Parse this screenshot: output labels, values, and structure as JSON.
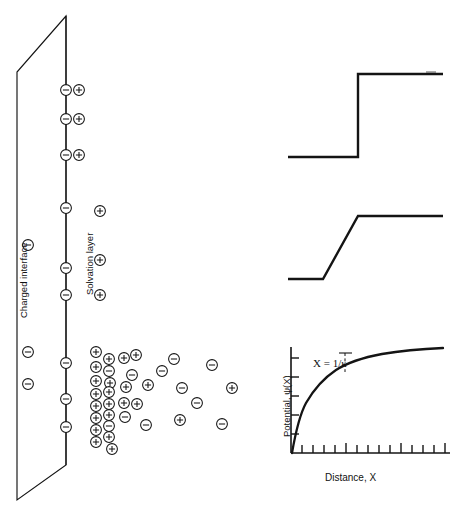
{
  "figure": {
    "stroke_color": "#141414",
    "panels": {
      "left": {
        "name": "interface-schematic",
        "labels": {
          "interface": "Charged interface",
          "solvation": "Solvation layer"
        },
        "interface_plane": {
          "top_right": [
            66,
            16
          ],
          "top_left": [
            17,
            72
          ],
          "bottom_left": [
            17,
            500
          ],
          "bottom_right": [
            66,
            465
          ]
        },
        "solvation_line": {
          "x": 66,
          "y_top": 16,
          "y_bottom": 465
        },
        "surface_charges": [
          {
            "sign": "minus",
            "x": 28,
            "y": 245
          },
          {
            "sign": "minus",
            "x": 28,
            "y": 352
          },
          {
            "sign": "minus",
            "x": 28,
            "y": 384
          }
        ],
        "solvation_pairs": [
          {
            "minus_x": 66,
            "plus_x": 79,
            "y": 90
          },
          {
            "minus_x": 66,
            "plus_x": 79,
            "y": 119
          },
          {
            "minus_x": 66,
            "plus_x": 79,
            "y": 155
          }
        ],
        "solvation_singles": [
          {
            "sign": "minus",
            "x": 66,
            "y": 208
          },
          {
            "sign": "minus",
            "x": 66,
            "y": 268
          },
          {
            "sign": "minus",
            "x": 66,
            "y": 295
          },
          {
            "sign": "minus",
            "x": 66,
            "y": 363
          },
          {
            "sign": "minus",
            "x": 66,
            "y": 399
          },
          {
            "sign": "minus",
            "x": 66,
            "y": 427
          }
        ],
        "diffuse_ions": [
          {
            "sign": "plus",
            "x": 100,
            "y": 211
          },
          {
            "sign": "plus",
            "x": 100,
            "y": 260
          },
          {
            "sign": "plus",
            "x": 100,
            "y": 295
          },
          {
            "sign": "plus",
            "x": 96,
            "y": 352
          },
          {
            "sign": "plus",
            "x": 109,
            "y": 359
          },
          {
            "sign": "plus",
            "x": 96,
            "y": 367
          },
          {
            "sign": "minus",
            "x": 109,
            "y": 371
          },
          {
            "sign": "plus",
            "x": 96,
            "y": 381
          },
          {
            "sign": "plus",
            "x": 110,
            "y": 383
          },
          {
            "sign": "plus",
            "x": 96,
            "y": 394
          },
          {
            "sign": "plus",
            "x": 109,
            "y": 392
          },
          {
            "sign": "plus",
            "x": 96,
            "y": 406
          },
          {
            "sign": "plus",
            "x": 109,
            "y": 404
          },
          {
            "sign": "plus",
            "x": 96,
            "y": 418
          },
          {
            "sign": "plus",
            "x": 109,
            "y": 415
          },
          {
            "sign": "minus",
            "x": 109,
            "y": 426
          },
          {
            "sign": "plus",
            "x": 96,
            "y": 430
          },
          {
            "sign": "plus",
            "x": 109,
            "y": 437
          },
          {
            "sign": "plus",
            "x": 96,
            "y": 442
          },
          {
            "sign": "plus",
            "x": 112,
            "y": 449
          },
          {
            "sign": "plus",
            "x": 124,
            "y": 358
          },
          {
            "sign": "plus",
            "x": 136,
            "y": 355
          },
          {
            "sign": "minus",
            "x": 132,
            "y": 375
          },
          {
            "sign": "plus",
            "x": 126,
            "y": 387
          },
          {
            "sign": "plus",
            "x": 124,
            "y": 403
          },
          {
            "sign": "minus",
            "x": 125,
            "y": 417
          },
          {
            "sign": "plus",
            "x": 137,
            "y": 404
          },
          {
            "sign": "minus",
            "x": 146,
            "y": 425
          },
          {
            "sign": "minus",
            "x": 162,
            "y": 371
          },
          {
            "sign": "plus",
            "x": 148,
            "y": 385
          },
          {
            "sign": "minus",
            "x": 174,
            "y": 359
          },
          {
            "sign": "minus",
            "x": 182,
            "y": 388
          },
          {
            "sign": "plus",
            "x": 180,
            "y": 420
          },
          {
            "sign": "minus",
            "x": 212,
            "y": 365
          },
          {
            "sign": "minus",
            "x": 197,
            "y": 403
          },
          {
            "sign": "plus",
            "x": 232,
            "y": 388
          },
          {
            "sign": "minus",
            "x": 222,
            "y": 424
          }
        ]
      },
      "top_right": {
        "name": "step-potential-plot",
        "type": "line",
        "points": [
          [
            288,
            157
          ],
          [
            358,
            157
          ],
          [
            358,
            74
          ],
          [
            443,
            74
          ]
        ]
      },
      "middle_right": {
        "name": "ramp-potential-plot",
        "type": "line",
        "points": [
          [
            288,
            279
          ],
          [
            323,
            279
          ],
          [
            358,
            216
          ],
          [
            443,
            216
          ]
        ]
      },
      "bottom_right": {
        "name": "diffuse-potential-plot",
        "type": "line",
        "xlabel": "Distance, X",
        "ylabel": "Potential, ψ(X)",
        "annotation": "X = 1/κ",
        "axes": {
          "origin": [
            291,
            453
          ],
          "x_end": 450,
          "y_top": 347,
          "x_ticks": 14,
          "y_ticks": 5
        },
        "marker": {
          "x": 345,
          "label": "X = 1/κ"
        }
      }
    }
  }
}
